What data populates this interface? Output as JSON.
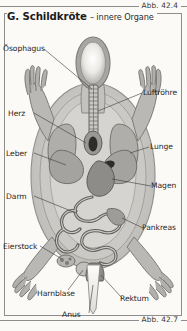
{
  "figure": {
    "top_caption": "Abb. 42.4",
    "bottom_caption": "Abb. 42.7",
    "title_main": "G. Schildkröte",
    "title_sub": "– innere Organe",
    "frame_color": "#8d8d8d",
    "background_color": "#fbfaf7",
    "ink_color": "#1f1f1f"
  },
  "labels": [
    {
      "id": "oesophagus",
      "text": "Ösophagus",
      "x": 3,
      "y": 45
    },
    {
      "id": "herz",
      "text": "Herz",
      "x": 8,
      "y": 110
    },
    {
      "id": "leber",
      "text": "Leber",
      "x": 6,
      "y": 150
    },
    {
      "id": "darm",
      "text": "Darm",
      "x": 6,
      "y": 193
    },
    {
      "id": "eierstock",
      "text": "Eierstock",
      "x": 3,
      "y": 243
    },
    {
      "id": "harnblase",
      "text": "Harnblase",
      "x": 37,
      "y": 290
    },
    {
      "id": "anus",
      "text": "Anus",
      "x": 62,
      "y": 311
    },
    {
      "id": "luftroehre",
      "text": "Luftröhre",
      "x": 143,
      "y": 89
    },
    {
      "id": "lunge",
      "text": "Lunge",
      "x": 150,
      "y": 143
    },
    {
      "id": "magen",
      "text": "Magen",
      "x": 151,
      "y": 182
    },
    {
      "id": "pankreas",
      "text": "Pankreas",
      "x": 142,
      "y": 224
    },
    {
      "id": "rektum",
      "text": "Rektum",
      "x": 120,
      "y": 295
    }
  ],
  "artwork": {
    "subject": "turtle-internal-organs-dorsal-view",
    "palette": {
      "shell_outline": "#a9a9a9",
      "shell_fill": "#d5d3cf",
      "body_fill": "#b9b7b3",
      "organ_light": "#cfcdc8",
      "organ_mid": "#9c9a96",
      "organ_dark": "#6e6c68",
      "heart_dark": "#2f2d2b",
      "tail_light": "#f3f1ed",
      "line": "#4a4846"
    }
  }
}
